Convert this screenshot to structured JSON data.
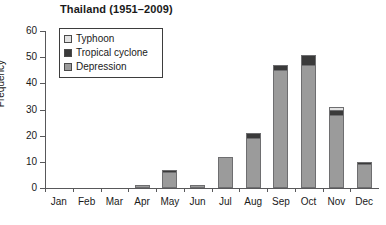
{
  "chart_data": {
    "type": "bar",
    "stacked": true,
    "title": "Thailand (1951–2009)",
    "xlabel": "",
    "ylabel": "Frequency",
    "ylim": [
      0,
      60
    ],
    "yticks": [
      0,
      10,
      20,
      30,
      40,
      50,
      60
    ],
    "grid": false,
    "legend_position": "top-left",
    "categories": [
      "Jan",
      "Feb",
      "Mar",
      "Apr",
      "May",
      "Jun",
      "Jul",
      "Aug",
      "Sep",
      "Oct",
      "Nov",
      "Dec"
    ],
    "series": [
      {
        "name": "Depression",
        "color": "#9b9b9b",
        "values": [
          0,
          0,
          0,
          1,
          6,
          1,
          12,
          19,
          45,
          47,
          28,
          9
        ]
      },
      {
        "name": "Tropical cyclone",
        "color": "#3a3a3a",
        "values": [
          0,
          0,
          0,
          0,
          1,
          0,
          0,
          2,
          2,
          4,
          2,
          1
        ]
      },
      {
        "name": "Typhoon",
        "color": "#e2e2e2",
        "values": [
          0,
          0,
          0,
          0,
          0,
          0,
          0,
          0,
          0,
          0,
          1,
          0
        ]
      }
    ],
    "totals": [
      0,
      0,
      0,
      1,
      7,
      1,
      12,
      21,
      47,
      51,
      31,
      10
    ]
  },
  "legend": {
    "items": [
      {
        "label": "Typhoon",
        "swatch": "swatch-typhoon"
      },
      {
        "label": "Tropical cyclone",
        "swatch": "swatch-cyclone"
      },
      {
        "label": "Depression",
        "swatch": "swatch-depression"
      }
    ]
  },
  "colors": {
    "depression": "#9b9b9b",
    "tropical_cyclone": "#3a3a3a",
    "typhoon": "#e2e2e2",
    "axis": "#58585a",
    "text": "#1a1a1a"
  }
}
